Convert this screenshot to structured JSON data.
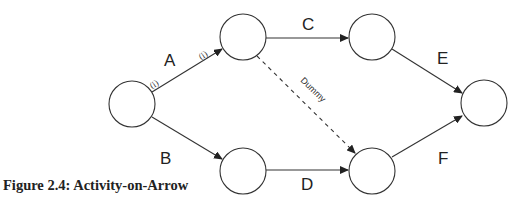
{
  "diagram": {
    "type": "activity-on-arrow network",
    "nodes": [
      {
        "id": 1,
        "cx": 132,
        "cy": 104,
        "r": 23
      },
      {
        "id": 2,
        "cx": 243,
        "cy": 37,
        "r": 23
      },
      {
        "id": 3,
        "cx": 243,
        "cy": 171,
        "r": 23
      },
      {
        "id": 4,
        "cx": 372,
        "cy": 37,
        "r": 23
      },
      {
        "id": 5,
        "cx": 372,
        "cy": 171,
        "r": 23
      },
      {
        "id": 6,
        "cx": 484,
        "cy": 103,
        "r": 23
      }
    ],
    "activities": [
      {
        "label": "A",
        "from": 1,
        "to": 2
      },
      {
        "label": "B",
        "from": 1,
        "to": 3
      },
      {
        "label": "C",
        "from": 2,
        "to": 4
      },
      {
        "label": "D",
        "from": 3,
        "to": 5
      },
      {
        "label": "E",
        "from": 4,
        "to": 6
      },
      {
        "label": "F",
        "from": 5,
        "to": 6
      },
      {
        "label": "Dummy",
        "from": 2,
        "to": 5,
        "dashed": true
      }
    ],
    "labels": {
      "A": "A",
      "B": "B",
      "C": "C",
      "D": "D",
      "E": "E",
      "F": "F",
      "dummy": "Dummy",
      "tail_mark": "(i)",
      "head_mark": "(i)"
    },
    "caption": "Figure 2.4: Activity-on-Arrow",
    "colors": {
      "stroke": "#333333",
      "text": "#222222",
      "background": "#ffffff"
    }
  }
}
